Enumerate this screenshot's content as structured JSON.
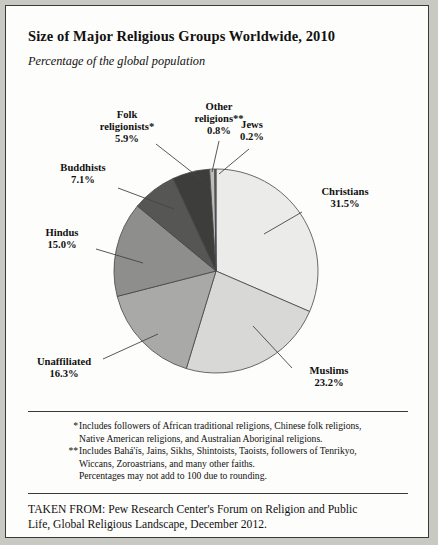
{
  "header": {
    "title": "Size of Major Religious Groups Worldwide, 2010",
    "subtitle": "Percentage of the global population"
  },
  "chart_data": {
    "type": "pie",
    "title": "Size of Major Religious Groups Worldwide, 2010",
    "subtitle": "Percentage of the global population",
    "unit": "percent",
    "start_angle_deg": 0,
    "direction": "clockwise",
    "legend": "labels-with-leader-lines",
    "categories": [
      "Christians",
      "Muslims",
      "Unaffiliated",
      "Hindus",
      "Buddhists",
      "Folk religionists*",
      "Other religions**",
      "Jews"
    ],
    "values": [
      31.5,
      23.2,
      16.3,
      15.0,
      7.1,
      5.9,
      0.8,
      0.2
    ],
    "colors": [
      "#ebebe9",
      "#d8d8d6",
      "#a9a9a7",
      "#8e8e8c",
      "#565654",
      "#3d3d3b",
      "#bdbdbb",
      "#6e6e6c"
    ],
    "slices": [
      {
        "name": "Christians",
        "label": "Christians",
        "pct": "31.5%",
        "value": 31.5,
        "color": "#ebebe9"
      },
      {
        "name": "Muslims",
        "label": "Muslims",
        "pct": "23.2%",
        "value": 23.2,
        "color": "#d8d8d6"
      },
      {
        "name": "Unaffiliated",
        "label": "Unaffiliated",
        "pct": "16.3%",
        "value": 16.3,
        "color": "#a9a9a7"
      },
      {
        "name": "Hindus",
        "label": "Hindus",
        "pct": "15.0%",
        "value": 15.0,
        "color": "#8e8e8c"
      },
      {
        "name": "Buddhists",
        "label": "Buddhists",
        "pct": "7.1%",
        "value": 7.1,
        "color": "#565654"
      },
      {
        "name": "Folk religionists",
        "label": "Folk religionists*",
        "pct": "5.9%",
        "value": 5.9,
        "color": "#3d3d3b"
      },
      {
        "name": "Other religions",
        "label": "Other religions**",
        "pct": "0.8%",
        "value": 0.8,
        "color": "#bdbdbb"
      },
      {
        "name": "Jews",
        "label": "Jews",
        "pct": "0.2%",
        "value": 0.2,
        "color": "#6e6e6c"
      }
    ]
  },
  "labels": {
    "christians": {
      "name": "Christians",
      "pct": "31.5%"
    },
    "muslims": {
      "name": "Muslims",
      "pct": "23.2%"
    },
    "unaffiliated": {
      "name": "Unaffiliated",
      "pct": "16.3%"
    },
    "hindus": {
      "name": "Hindus",
      "pct": "15.0%"
    },
    "buddhists": {
      "name": "Buddhists",
      "pct": "7.1%"
    },
    "folk": {
      "name": "Folk",
      "name2": "religionists*",
      "pct": "5.9%"
    },
    "other": {
      "name": "Other",
      "name2": "religions**",
      "pct": "0.8%"
    },
    "jews": {
      "name": "Jews",
      "pct": "0.2%"
    }
  },
  "notes": {
    "mark1": "*",
    "note1_line1": "Includes followers of African traditional religions, Chinese folk religions,",
    "note1_line2": "Native American religions, and Australian Aboriginal religions.",
    "mark2": "**",
    "note2_line1": "Includes Bahá'ís, Jains, Sikhs, Shintoists, Taoists, followers of Tenrikyo,",
    "note2_line2": "Wiccans, Zoroastrians, and many other faiths.",
    "note3": "Percentages may not add to 100 due to rounding."
  },
  "source": {
    "line1": "TAKEN FROM: Pew Research Center's Forum on Religion and Public",
    "line2": "Life, Global Religious Landscape, December 2012."
  }
}
